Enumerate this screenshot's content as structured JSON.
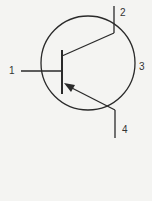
{
  "diagram": {
    "type": "pnp-transistor-symbol",
    "stroke_color": "#2a2a2a",
    "background": "#f4f4f2",
    "terminals": [
      {
        "id": "1",
        "label": "1",
        "role": "base"
      },
      {
        "id": "2",
        "label": "2",
        "role": "collector"
      },
      {
        "id": "3",
        "label": "3",
        "role": "envelope"
      },
      {
        "id": "4",
        "label": "4",
        "role": "emitter"
      }
    ]
  }
}
